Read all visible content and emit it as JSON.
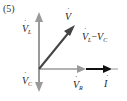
{
  "figure_number": "(5)",
  "diagram": {
    "type": "phasor-diagram",
    "origin": [
      39,
      69
    ],
    "phasors": [
      {
        "id": "VL",
        "label": "V",
        "sub": "L",
        "direction": "up",
        "color": "#999999"
      },
      {
        "id": "VC",
        "label": "V",
        "sub": "C",
        "direction": "down",
        "color": "#999999"
      },
      {
        "id": "VR",
        "label": "V",
        "sub": "R",
        "direction": "right",
        "color": "#999999"
      },
      {
        "id": "I",
        "label": "I",
        "sub": "",
        "direction": "right",
        "color": "#111111"
      },
      {
        "id": "V",
        "label": "V",
        "sub": "",
        "direction": "diagonal",
        "color": "#444444"
      }
    ],
    "annotation": {
      "label": "V",
      "sub1": "L",
      "minus": "−",
      "label2": "V",
      "sub2": "C"
    }
  },
  "colors": {
    "axis_gray": "#999999",
    "current_black": "#111111",
    "voltage_dark": "#444444"
  }
}
